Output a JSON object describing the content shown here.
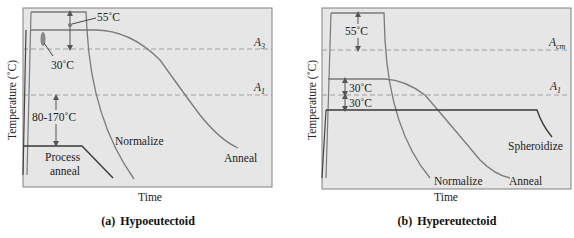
{
  "figure": {
    "colors": {
      "panel_bg": "#e6e6e6",
      "panel_border": "#808080",
      "curve": "#7a7a7a",
      "dark_line": "#3a3a3a",
      "dashed": "#a0a0a0",
      "arrow": "#555555"
    },
    "panel_a": {
      "caption_letter": "(a)",
      "caption_title": "Hypoeutectoid",
      "y_axis_label": "Temperature (˚C)",
      "x_axis_label": "Time",
      "line_labels": {
        "upper": "A",
        "upper_sub": "3",
        "lower": "A",
        "lower_sub": "1"
      },
      "annotations": {
        "normalize_offset": "55˚C",
        "anneal_offset": "30˚C",
        "process_anneal_offset": "80-170˚C"
      },
      "curve_labels": {
        "normalize": "Normalize",
        "anneal": "Anneal",
        "process_anneal_1": "Process",
        "process_anneal_2": "anneal"
      }
    },
    "panel_b": {
      "caption_letter": "(b)",
      "caption_title": "Hypereutectoid",
      "y_axis_label": "Temperature (˚C)",
      "x_axis_label": "Time",
      "line_labels": {
        "upper": "A",
        "upper_sub": "cm",
        "lower": "A",
        "lower_sub": "1"
      },
      "annotations": {
        "normalize_offset": "55˚C",
        "anneal_offset_above": "30˚C",
        "spheroidize_offset_below": "30˚C"
      },
      "curve_labels": {
        "normalize": "Normalize",
        "anneal": "Anneal",
        "spheroidize": "Spheroidize"
      }
    }
  }
}
